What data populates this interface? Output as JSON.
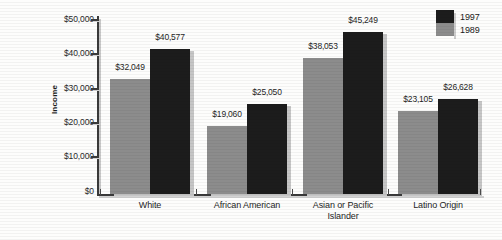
{
  "chart_data": {
    "type": "bar",
    "title": "",
    "xlabel": "",
    "ylabel": "Income",
    "ylim": [
      0,
      50000
    ],
    "ytick_labels": [
      "$50,000",
      "$40,000",
      "$30,000",
      "$20,000",
      "$10,000",
      "$0"
    ],
    "ytick_values": [
      50000,
      40000,
      30000,
      20000,
      10000,
      0
    ],
    "grid": false,
    "legend_position": "top-right",
    "categories": [
      "White",
      "African American",
      "Asian or Pacific Islander",
      "Latino Origin"
    ],
    "series": [
      {
        "name": "1989",
        "color": "#8c8c8c",
        "values": [
          32049,
          19060,
          38053,
          23105
        ],
        "labels": [
          "$32,049",
          "$19,060",
          "$38,053",
          "$23,105"
        ]
      },
      {
        "name": "1997",
        "color": "#1c1c1c",
        "values": [
          40577,
          25050,
          45249,
          26628
        ],
        "labels": [
          "$40,577",
          "$25,050",
          "$45,249",
          "$26,628"
        ]
      }
    ]
  },
  "axis": {
    "y_title": "Income",
    "ticks": [
      {
        "label": "$50,000",
        "top": 14
      },
      {
        "label": "$40,000",
        "top": 48
      },
      {
        "label": "$30,000",
        "top": 83
      },
      {
        "label": "$20,000",
        "top": 117
      },
      {
        "label": "$10,000",
        "top": 151
      },
      {
        "label": "$0",
        "top": 186
      }
    ]
  },
  "legend": {
    "items": [
      {
        "label": "1997",
        "color": "#1c1c1c"
      },
      {
        "label": "1989",
        "color": "#8c8c8c"
      }
    ]
  },
  "groups": [
    {
      "category": "White",
      "category_line2": "",
      "center": 150,
      "bars": [
        {
          "series": "1989",
          "label": "$32,049",
          "left": 110,
          "width": 40,
          "height": 115,
          "color": "#8c8c8c",
          "label_left": 95,
          "label_top": 62
        },
        {
          "series": "1997",
          "label": "$40,577",
          "left": 150,
          "width": 40,
          "height": 145,
          "color": "#1c1c1c",
          "label_left": 135,
          "label_top": 32
        }
      ]
    },
    {
      "category": "African American",
      "category_line2": "",
      "center": 247,
      "bars": [
        {
          "series": "1989",
          "label": "$19,060",
          "left": 207,
          "width": 40,
          "height": 68,
          "color": "#8c8c8c",
          "label_left": 192,
          "label_top": 109
        },
        {
          "series": "1997",
          "label": "$25,050",
          "left": 247,
          "width": 40,
          "height": 90,
          "color": "#1c1c1c",
          "label_left": 232,
          "label_top": 87
        }
      ]
    },
    {
      "category": "Asian or Pacific",
      "category_line2": "Islander",
      "center": 343,
      "bars": [
        {
          "series": "1989",
          "label": "$38,053",
          "left": 303,
          "width": 40,
          "height": 136,
          "color": "#8c8c8c",
          "label_left": 288,
          "label_top": 41
        },
        {
          "series": "1997",
          "label": "$45,249",
          "left": 343,
          "width": 40,
          "height": 162,
          "color": "#1c1c1c",
          "label_left": 328,
          "label_top": 15
        }
      ]
    },
    {
      "category": "Latino Origin",
      "category_line2": "",
      "center": 438,
      "bars": [
        {
          "series": "1989",
          "label": "$23,105",
          "left": 398,
          "width": 40,
          "height": 83,
          "color": "#8c8c8c",
          "label_left": 383,
          "label_top": 94
        },
        {
          "series": "1997",
          "label": "$26,628",
          "left": 438,
          "width": 40,
          "height": 95,
          "color": "#1c1c1c",
          "label_left": 423,
          "label_top": 82
        }
      ]
    }
  ],
  "xticks": [
    100,
    196,
    292,
    388,
    480
  ]
}
